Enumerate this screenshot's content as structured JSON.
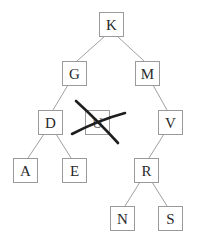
{
  "diagram": {
    "type": "binary-search-tree",
    "nodes": [
      {
        "id": "K",
        "label": "K",
        "x": 99,
        "y": 12
      },
      {
        "id": "G",
        "label": "G",
        "x": 62,
        "y": 61
      },
      {
        "id": "M",
        "label": "M",
        "x": 135,
        "y": 61
      },
      {
        "id": "D",
        "label": "D",
        "x": 38,
        "y": 110
      },
      {
        "id": "U",
        "label": "U",
        "x": 85,
        "y": 110,
        "crossed_out": true
      },
      {
        "id": "V",
        "label": "V",
        "x": 158,
        "y": 110
      },
      {
        "id": "A",
        "label": "A",
        "x": 13,
        "y": 158
      },
      {
        "id": "E",
        "label": "E",
        "x": 62,
        "y": 158
      },
      {
        "id": "R",
        "label": "R",
        "x": 134,
        "y": 158
      },
      {
        "id": "N",
        "label": "N",
        "x": 110,
        "y": 206
      },
      {
        "id": "S",
        "label": "S",
        "x": 158,
        "y": 206
      }
    ],
    "edges": [
      [
        "K",
        "G"
      ],
      [
        "K",
        "M"
      ],
      [
        "G",
        "D"
      ],
      [
        "M",
        "V"
      ],
      [
        "D",
        "A"
      ],
      [
        "D",
        "E"
      ],
      [
        "V",
        "R"
      ],
      [
        "R",
        "N"
      ],
      [
        "R",
        "S"
      ]
    ],
    "box_size": 24,
    "colors": {
      "box_stroke": "#9a9a9a",
      "edge": "#a0a0a0",
      "label": "#2a2a2a",
      "cross": "#1e1e1e"
    }
  }
}
